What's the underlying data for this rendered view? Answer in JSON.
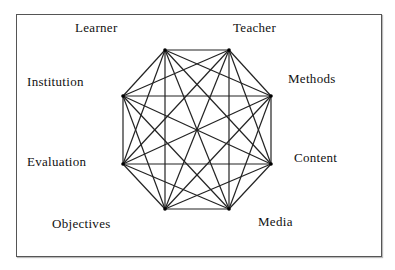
{
  "diagram": {
    "type": "complete-graph-octagon",
    "nodes": [
      {
        "id": "learner",
        "label": "Learner",
        "vertex": [
          165,
          50
        ],
        "label_pos": [
          75,
          21
        ]
      },
      {
        "id": "teacher",
        "label": "Teacher",
        "vertex": [
          229,
          50
        ],
        "label_pos": [
          233,
          21
        ]
      },
      {
        "id": "methods",
        "label": "Methods",
        "vertex": [
          271,
          96
        ],
        "label_pos": [
          288,
          72
        ]
      },
      {
        "id": "content",
        "label": "Content",
        "vertex": [
          271,
          164
        ],
        "label_pos": [
          294,
          151
        ]
      },
      {
        "id": "media",
        "label": "Media",
        "vertex": [
          229,
          209
        ],
        "label_pos": [
          258,
          215
        ]
      },
      {
        "id": "objectives",
        "label": "Objectives",
        "vertex": [
          165,
          209
        ],
        "label_pos": [
          52,
          217
        ]
      },
      {
        "id": "evaluation",
        "label": "Evaluation",
        "vertex": [
          123,
          164
        ],
        "label_pos": [
          27,
          155
        ]
      },
      {
        "id": "institution",
        "label": "Institution",
        "vertex": [
          123,
          96
        ],
        "label_pos": [
          27,
          75
        ]
      }
    ],
    "edges": "all-pairs",
    "colors": {
      "line": "#222222",
      "frame": "#555555",
      "text": "#111111"
    }
  }
}
